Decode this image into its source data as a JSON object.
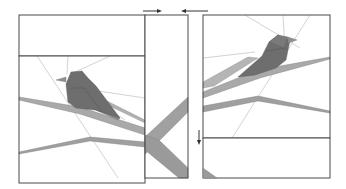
{
  "diagram": {
    "colors": {
      "background": "#ffffff",
      "outline": "#4a4a4a",
      "guide_line": "#b5b5b5",
      "bird_dark": "#6e6e6e",
      "bird_mid": "#8a8a8a",
      "branch_light": "#a9a9a9",
      "branch_mid": "#9a9a9a"
    },
    "arrows": [
      {
        "id": "join-right",
        "direction": "right"
      },
      {
        "id": "join-left",
        "direction": "left"
      },
      {
        "id": "join-down",
        "direction": "down"
      }
    ],
    "sections": [
      {
        "id": "left-top-block"
      },
      {
        "id": "left-bird-block"
      },
      {
        "id": "center-strip"
      },
      {
        "id": "right-bird-block"
      },
      {
        "id": "right-bottom-block"
      }
    ]
  }
}
